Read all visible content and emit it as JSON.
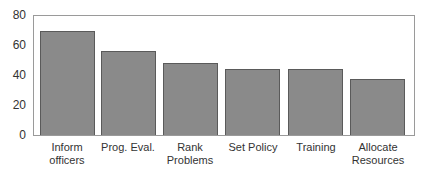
{
  "chart_data": {
    "type": "bar",
    "title": "",
    "xlabel": "",
    "ylabel": "",
    "categories": [
      "Inform officers",
      "Prog. Eval.",
      "Rank Problems",
      "Set Policy",
      "Training",
      "Allocate Resources"
    ],
    "category_labels_display": [
      "Inform\nofficers",
      "Prog. Eval.",
      "Rank\nProblems",
      "Set Policy",
      "Training",
      "Allocate\nResources"
    ],
    "values": [
      69,
      56,
      48,
      44,
      44,
      37
    ],
    "ylim": [
      0,
      80
    ],
    "yticks": [
      "0",
      "20",
      "40",
      "60",
      "80"
    ],
    "grid": false,
    "legend": null,
    "bar_color": "#8a8a8a"
  }
}
